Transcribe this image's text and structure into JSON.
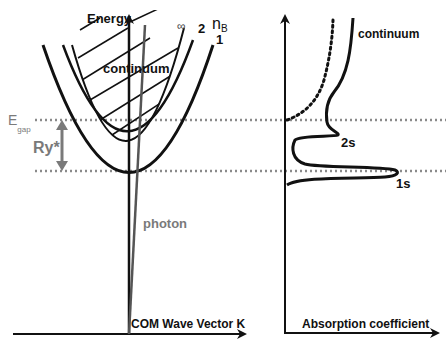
{
  "left_panel": {
    "y_axis_label": "Energy",
    "x_axis_label": "COM Wave Vector K",
    "quantum_number_label": "n",
    "quantum_number_subscript": "B",
    "curve_labels": [
      "∞",
      "2",
      "1"
    ],
    "continuum_label": "continuum",
    "photon_label": "photon",
    "gap_label": "E",
    "gap_subscript": "gap",
    "rydberg_label": "Ry*"
  },
  "right_panel": {
    "x_axis_label": "Absorption coefficient",
    "continuum_label": "continuum",
    "peak_labels": [
      "2s",
      "1s"
    ]
  },
  "colors": {
    "line": "#111111",
    "grey": "#7a7a7a",
    "dotted": "#8a8a8a"
  }
}
